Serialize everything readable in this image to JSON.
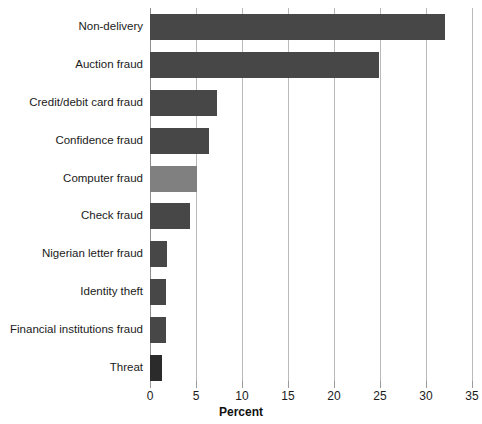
{
  "chart_data": {
    "type": "bar",
    "orientation": "horizontal",
    "title": "",
    "xlabel": "Percent",
    "ylabel": "",
    "xlim": [
      0,
      35
    ],
    "xticks": [
      0,
      5,
      10,
      15,
      20,
      25,
      30,
      35
    ],
    "xtick_labels": [
      "0",
      "5",
      "10",
      "15",
      "20",
      "25",
      "30",
      "35"
    ],
    "grid": true,
    "legend": "none",
    "categories": [
      "Non-delivery",
      "Auction fraud",
      "Credit/debit card fraud",
      "Confidence fraud",
      "Computer fraud",
      "Check fraud",
      "Nigerian letter fraud",
      "Identity theft",
      "Financial institutions fraud",
      "Threat"
    ],
    "values": [
      32.1,
      24.9,
      7.3,
      6.4,
      5.1,
      4.4,
      1.9,
      1.7,
      1.7,
      1.3
    ],
    "bar_colors": [
      "#474747",
      "#474747",
      "#474747",
      "#474747",
      "#808080",
      "#474747",
      "#474747",
      "#474747",
      "#474747",
      "#2b2b2b"
    ],
    "highlight_category": "Computer fraud",
    "grid_color": "#b9b9b9",
    "axis_color": "#8e8e8e",
    "text_color": "#1b1b1b"
  }
}
